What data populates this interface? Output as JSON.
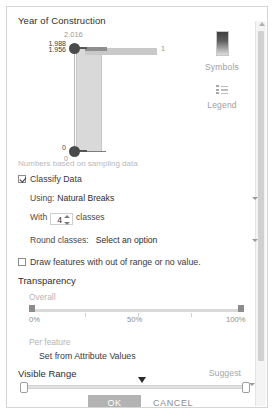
{
  "panel": {
    "field_title": "Year of Construction"
  },
  "histogram": {
    "max_label": "2.016",
    "range_high_label": "1.988",
    "range_low_extra_label": "1.956",
    "selected_min_label": "0",
    "axis_zero_label": "0",
    "bar_count_label": "1"
  },
  "rail": {
    "symbols_label": "Symbols",
    "legend_label": "Legend",
    "symbols_icon": "gradient-swatch-icon",
    "legend_icon": "legend-list-icon"
  },
  "scrollbar": {
    "up_arrow_icon": "scroll-up-arrow-icon"
  },
  "classify": {
    "note": "Numbers based on sampling data",
    "classify_data_label": "Classify Data",
    "classify_data_checked": true,
    "using_label": "Using:",
    "using_value": "Natural Breaks",
    "with_label": "With",
    "classes_count": "4",
    "classes_label": "classes",
    "round_classes_label": "Round classes:",
    "round_classes_value": "Select an option",
    "draw_features_label": "Draw features with out of range or no value.",
    "draw_features_checked": false
  },
  "transparency": {
    "section_title": "Transparency",
    "overall_label": "Overall",
    "scale_min": "0%",
    "scale_mid": "50%",
    "scale_max": "100%",
    "per_feature_label": "Per feature",
    "set_from_attribute_label": "Set from Attribute Values"
  },
  "visible_range": {
    "section_title": "Visible Range",
    "suggest_label": "Suggest"
  },
  "footer": {
    "ok_label": "OK",
    "cancel_label": "CANCEL"
  }
}
